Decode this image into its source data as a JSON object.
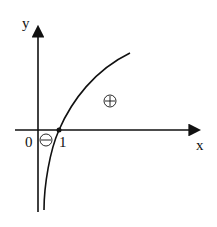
{
  "diagram": {
    "axes": {
      "x_label": "x",
      "y_label": "y",
      "origin_label": "0"
    },
    "point": {
      "label": "1"
    },
    "regions": {
      "positive": "⊕",
      "negative": "⊖"
    },
    "colors": {
      "stroke": "#111111",
      "background": "#ffffff"
    }
  }
}
